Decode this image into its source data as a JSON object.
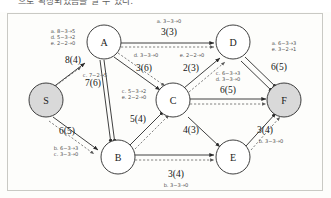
{
  "header": {
    "text": "으로 확장되었음을 알 수 있다."
  },
  "figure": {
    "type": "network-flow-graph",
    "colors": {
      "node_plain_fill": "#ffffff",
      "node_shaded_fill": "#d9d9d9",
      "node_stroke": "#2a2a2a",
      "edge_solid": "#2a2a2a",
      "edge_dashed": "#5a5a5a",
      "flow_label": "#141414",
      "aug_label": "#4e4e4e",
      "border": "#c9c9c4",
      "background": "#fdfdfb"
    },
    "nodes": [
      {
        "id": "A",
        "label": "A",
        "x": 103,
        "y": 42,
        "r": 17,
        "shaded": false
      },
      {
        "id": "D",
        "label": "D",
        "x": 232,
        "y": 42,
        "r": 17,
        "shaded": false
      },
      {
        "id": "S",
        "label": "S",
        "x": 45,
        "y": 100,
        "r": 17,
        "shaded": true
      },
      {
        "id": "C",
        "label": "C",
        "x": 172,
        "y": 100,
        "r": 17,
        "shaded": false
      },
      {
        "id": "F",
        "label": "F",
        "x": 283,
        "y": 100,
        "r": 17,
        "shaded": true
      },
      {
        "id": "B",
        "label": "B",
        "x": 117,
        "y": 157,
        "r": 17,
        "shaded": false
      },
      {
        "id": "E",
        "label": "E",
        "x": 232,
        "y": 157,
        "r": 17,
        "shaded": false
      }
    ],
    "edges": [
      {
        "id": "S-A",
        "from": "S",
        "to": "A",
        "flow": "8(4)",
        "flow_x": 72,
        "flow_y": 63,
        "augmentations": [
          "a. 8−3→5",
          "d. 5−3→2",
          "e. 2−2→0"
        ],
        "aug_x": 62,
        "aug_y": 33
      },
      {
        "id": "A-D",
        "from": "A",
        "to": "D",
        "flow": "3(3)",
        "flow_x": 168,
        "flow_y": 35,
        "augmentations": [
          "a. 3−3→0"
        ],
        "aug_x": 168,
        "aug_y": 23
      },
      {
        "id": "A-B",
        "from": "A",
        "to": "B",
        "flow": "7(6)",
        "flow_x": 92,
        "flow_y": 86,
        "augmentations": [
          "c. 7−2→5"
        ],
        "aug_x": 94,
        "aug_y": 77
      },
      {
        "id": "A-C",
        "from": "A",
        "to": "C",
        "flow": "3(6)",
        "flow_x": 143,
        "flow_y": 71,
        "augmentations": [
          "d. 3−3→0"
        ],
        "aug_x": 145,
        "aug_y": 57
      },
      {
        "id": "C-D",
        "from": "C",
        "to": "D",
        "flow": "2(3)",
        "flow_x": 190,
        "flow_y": 71,
        "augmentations": [
          "e. 2−2→0"
        ],
        "aug_x": 191,
        "aug_y": 57
      },
      {
        "id": "D-F",
        "from": "D",
        "to": "F",
        "flow": "6(5)",
        "flow_x": 278,
        "flow_y": 70,
        "augmentations": [
          "a. 6−3→3",
          "e. 3−2→1"
        ],
        "aug_x": 283,
        "aug_y": 45
      },
      {
        "id": "C-F",
        "from": "C",
        "to": "F",
        "flow": "6(5)",
        "flow_x": 227,
        "flow_y": 93,
        "augmentations": [
          "c. 6−3→3",
          "d. 3−3→0"
        ],
        "aug_x": 227,
        "aug_y": 75
      },
      {
        "id": "B-C",
        "from": "B",
        "to": "C",
        "flow": "5(4)",
        "flow_x": 137,
        "flow_y": 122,
        "augmentations": [
          "c. 5−3→2",
          "e. 2−2→0"
        ],
        "aug_x": 133,
        "aug_y": 93
      },
      {
        "id": "S-B",
        "from": "S",
        "to": "B",
        "flow": "6(5)",
        "flow_x": 66,
        "flow_y": 134,
        "augmentations": [
          "b. 6−3→3",
          "c. 3−3→0"
        ],
        "aug_x": 65,
        "aug_y": 150
      },
      {
        "id": "C-E",
        "from": "C",
        "to": "E",
        "flow": "4(3)",
        "flow_x": 190,
        "flow_y": 133,
        "augmentations": [],
        "aug_x": 190,
        "aug_y": 145
      },
      {
        "id": "B-E",
        "from": "B",
        "to": "E",
        "flow": "3(4)",
        "flow_x": 175,
        "flow_y": 177,
        "augmentations": [
          "b. 3−3→0"
        ],
        "aug_x": 175,
        "aug_y": 187
      },
      {
        "id": "E-F",
        "from": "E",
        "to": "F",
        "flow": "3(4)",
        "flow_x": 264,
        "flow_y": 133,
        "augmentations": [
          "b. 3−3→0"
        ],
        "aug_x": 270,
        "aug_y": 143
      }
    ]
  }
}
